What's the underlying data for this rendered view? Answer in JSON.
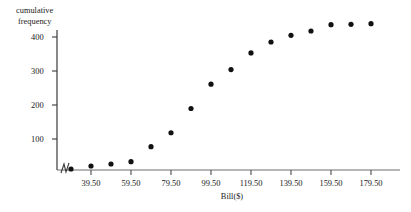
{
  "chart_data": {
    "type": "scatter",
    "title": "",
    "xlabel": "Bill($)",
    "ylabel": "cumulative frequency",
    "ylabel_line1": "cumulative",
    "ylabel_line2": "frequency",
    "grid": false,
    "legend": "none",
    "axis_break_x": true,
    "xlim": [
      19.5,
      189.5
    ],
    "ylim": [
      0,
      470
    ],
    "xticks": [
      "39.50",
      "59.50",
      "79.50",
      "99.50",
      "119.50",
      "139.50",
      "159.50",
      "179.50"
    ],
    "xtick_values": [
      39.5,
      59.5,
      79.5,
      99.5,
      119.5,
      139.5,
      159.5,
      179.5
    ],
    "yticks": [
      "100",
      "200",
      "300",
      "400"
    ],
    "ytick_values": [
      100,
      200,
      300,
      400
    ],
    "x": [
      29.5,
      39.5,
      49.5,
      59.5,
      69.5,
      79.5,
      89.5,
      99.5,
      109.5,
      119.5,
      129.5,
      139.5,
      149.5,
      159.5,
      169.5,
      179.5
    ],
    "y": [
      3,
      12,
      18,
      25,
      70,
      112,
      185,
      258,
      302,
      352,
      385,
      405,
      418,
      437,
      438,
      440
    ],
    "values": [
      3,
      12,
      18,
      25,
      70,
      112,
      185,
      258,
      302,
      352,
      385,
      405,
      418,
      437,
      438,
      440
    ],
    "point_color": "#111111",
    "axis_color": "#4a4a4a"
  }
}
